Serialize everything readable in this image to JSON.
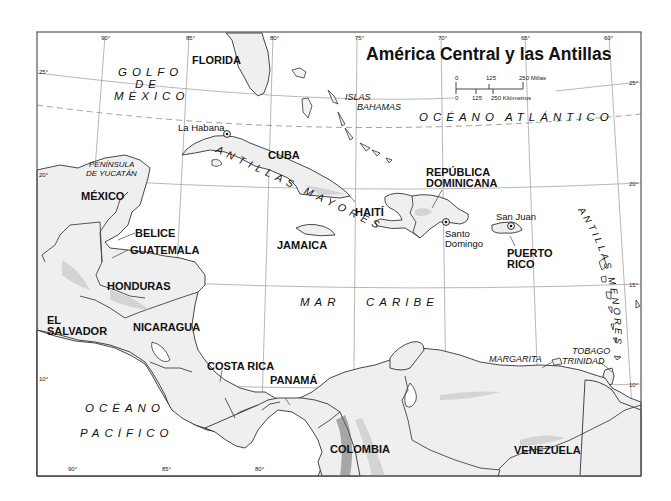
{
  "title": "América Central y las Antillas",
  "scale": {
    "miles": {
      "ticks": [
        "0",
        "125",
        "250 Millas"
      ]
    },
    "km": {
      "ticks": [
        "0",
        "125",
        "250 Kilómetros"
      ]
    }
  },
  "graticule": {
    "longitudes_top": [
      "90°",
      "85°",
      "80°",
      "75°",
      "70°",
      "65°",
      "60°"
    ],
    "longitudes_bottom": [
      "90°",
      "85°",
      "80°"
    ],
    "latitudes_left": [
      "25°",
      "20°",
      "10°"
    ],
    "latitudes_right": [
      "25°",
      "20°",
      "15°",
      "10°"
    ]
  },
  "labels": {
    "countries": {
      "mexico": "MÉXICO",
      "belice": "BELICE",
      "guatemala": "GUATEMALA",
      "honduras": "HONDURAS",
      "el_salvador_1": "EL",
      "el_salvador_2": "SALVADOR",
      "nicaragua": "NICARAGUA",
      "costa_rica": "COSTA RICA",
      "panama": "PANAMÁ",
      "colombia": "COLOMBIA",
      "venezuela": "VENEZUELA",
      "cuba": "CUBA",
      "jamaica": "JAMAICA",
      "haiti": "HAITÍ",
      "rep_dom_1": "REPÚBLICA",
      "rep_dom_2": "DOMINICANA",
      "puerto_rico_1": "PUERTO",
      "puerto_rico_2": "RICO",
      "florida": "FLORIDA"
    },
    "regions": {
      "yucatan_1": "PENÍNSULA",
      "yucatan_2": "DE YUCATÁN",
      "bahamas_1": "ISLAS",
      "bahamas_2": "BAHAMAS",
      "margarita": "MARGARITA",
      "tobago": "TOBAGO",
      "trinidad": "TRINIDAD"
    },
    "cities": {
      "habana": "La Habana",
      "santo_domingo_1": "Santo",
      "santo_domingo_2": "Domingo",
      "san_juan": "San Juan"
    },
    "water": {
      "golfo_1": "GOLFO",
      "golfo_2": "DE",
      "golfo_3": "MÉXICO",
      "atlantico_1": "OCÉANO",
      "atlantico_2": "ATLÁNTICO",
      "caribe_1": "MAR",
      "caribe_2": "CARIBE",
      "pacifico_1": "OCÉANO",
      "pacifico_2": "PACÍFICO"
    },
    "arcs": {
      "antillas_mayores": "ANTILLAS MAYORES",
      "antillas_menores": "ANTILLAS MENORES"
    }
  },
  "colors": {
    "land": "#efefef",
    "water": "#ffffff",
    "coast": "#333333",
    "grid": "#9a9a9a"
  }
}
